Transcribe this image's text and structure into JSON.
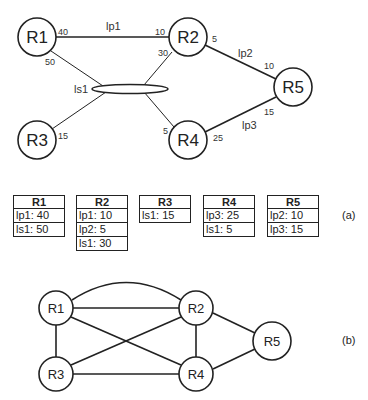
{
  "diagram_a": {
    "routers": [
      {
        "id": "R1",
        "label": "R1",
        "x": 37,
        "y": 37
      },
      {
        "id": "R2",
        "label": "R2",
        "x": 188,
        "y": 37
      },
      {
        "id": "R3",
        "label": "R3",
        "x": 37,
        "y": 140
      },
      {
        "id": "R4",
        "label": "R4",
        "x": 188,
        "y": 140
      },
      {
        "id": "R5",
        "label": "R5",
        "x": 293,
        "y": 87
      }
    ],
    "links": [
      {
        "name": "lp1",
        "from": "R1",
        "to": "R2",
        "costs": {
          "R1": "40",
          "R2": "10"
        }
      },
      {
        "name": "lp2",
        "from": "R2",
        "to": "R5",
        "costs": {
          "R2": "5",
          "R5": "10"
        }
      },
      {
        "name": "lp3",
        "from": "R4",
        "to": "R5",
        "costs": {
          "R4": "25",
          "R5": "15"
        }
      }
    ],
    "lan": {
      "name": "ls1",
      "costs": {
        "R1": "50",
        "R2": "30",
        "R3": "15",
        "R4": "5"
      }
    },
    "labels": {
      "lp1": "lp1",
      "lp2": "lp2",
      "lp3": "lp3",
      "ls1": "ls1",
      "c_r1_lp1": "40",
      "c_r2_lp1": "10",
      "c_r2_lp2": "5",
      "c_r5_lp2": "10",
      "c_r5_lp3": "15",
      "c_r4_lp3": "25",
      "c_r1_ls1": "50",
      "c_r2_ls1": "30",
      "c_r3_ls1": "15",
      "c_r4_ls1": "5"
    }
  },
  "tables": [
    {
      "router": "R1",
      "rows": [
        "lp1: 40",
        "ls1: 50"
      ]
    },
    {
      "router": "R2",
      "rows": [
        "lp1: 10",
        "lp2: 5",
        "ls1: 30"
      ]
    },
    {
      "router": "R3",
      "rows": [
        "ls1: 15"
      ]
    },
    {
      "router": "R4",
      "rows": [
        "lp3: 25",
        "ls1: 5"
      ]
    },
    {
      "router": "R5",
      "rows": [
        "lp2: 10",
        "lp3: 15"
      ]
    }
  ],
  "caption_a": "(a)",
  "diagram_b": {
    "nodes": [
      "R1",
      "R2",
      "R3",
      "R4",
      "R5"
    ],
    "edges": [
      [
        "R1",
        "R2"
      ],
      [
        "R1",
        "R2"
      ],
      [
        "R1",
        "R3"
      ],
      [
        "R1",
        "R4"
      ],
      [
        "R2",
        "R3"
      ],
      [
        "R2",
        "R4"
      ],
      [
        "R2",
        "R5"
      ],
      [
        "R3",
        "R4"
      ],
      [
        "R4",
        "R5"
      ]
    ]
  },
  "caption_b": "(b)"
}
